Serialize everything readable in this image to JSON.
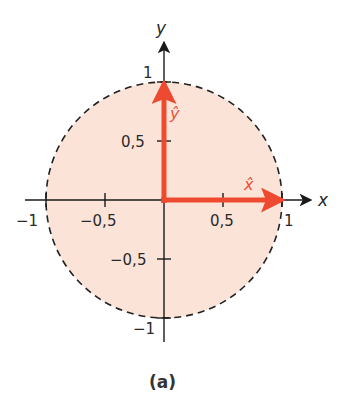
{
  "diagram": {
    "caption": "(a)",
    "axes": {
      "x_label": "x",
      "y_label": "y"
    },
    "x_ticks": [
      "−1",
      "−0,5",
      "0,5",
      "1"
    ],
    "y_ticks": [
      "1",
      "0,5",
      "−0,5",
      "−1"
    ],
    "vectors": {
      "x_hat": "x̂",
      "y_hat": "ŷ"
    },
    "colors": {
      "circle_fill": "#fbe3d8",
      "circle_stroke": "#222222",
      "vector": "#ee4a2f",
      "axis": "#1a1a1a"
    }
  }
}
